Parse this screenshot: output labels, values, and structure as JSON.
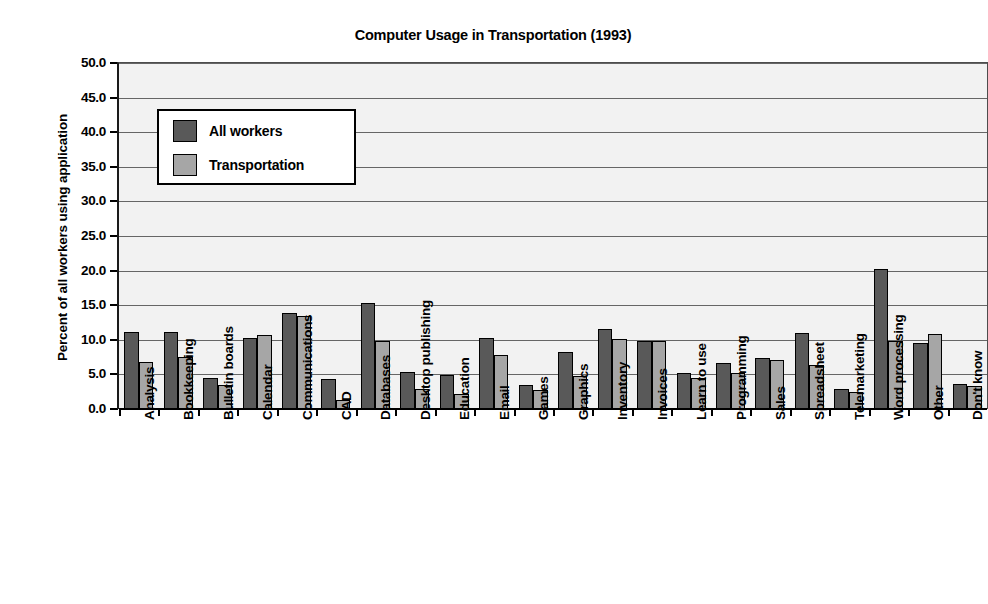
{
  "chart_data": {
    "type": "bar",
    "title": "Computer Usage in Transportation (1993)",
    "xlabel": "",
    "ylabel": "Percent of all workers using application",
    "ylim": [
      0,
      50
    ],
    "ytick_labels": [
      "50.0",
      "45.0",
      "40.0",
      "35.0",
      "30.0",
      "25.0",
      "20.0",
      "15.0",
      "10.0",
      "5.0",
      "0.0"
    ],
    "ytick_values": [
      50,
      45,
      40,
      35,
      30,
      25,
      20,
      15,
      10,
      5,
      0
    ],
    "grid": true,
    "legend_position": "upper-left-inside",
    "categories": [
      "Analysis",
      "Bookkeeping",
      "Bulletin boards",
      "Calendar",
      "Communications",
      "CAD",
      "Databases",
      "Desktop publishing",
      "Education",
      "Email",
      "Games",
      "Graphics",
      "Inventory",
      "Invoices",
      "Learn to use",
      "Programming",
      "Sales",
      "Spreadsheet",
      "Telemarketing",
      "Word processing",
      "Other",
      "Don't know"
    ],
    "series": [
      {
        "name": "All workers",
        "color": "#595959",
        "values": [
          11.1,
          11.1,
          4.5,
          10.3,
          13.9,
          4.4,
          15.3,
          5.3,
          4.9,
          10.2,
          3.5,
          8.3,
          11.6,
          9.8,
          5.2,
          6.6,
          7.4,
          11.0,
          2.9,
          20.3,
          9.6,
          3.6
        ]
      },
      {
        "name": "Transportation",
        "color": "#a6a6a6",
        "values": [
          6.8,
          7.5,
          3.5,
          10.7,
          13.5,
          1.3,
          9.8,
          2.9,
          2.2,
          7.8,
          2.7,
          4.8,
          10.1,
          9.8,
          4.5,
          5.2,
          7.1,
          6.3,
          2.5,
          9.8,
          10.8,
          3.3
        ]
      }
    ],
    "legend": [
      {
        "label": "All workers",
        "color": "#595959"
      },
      {
        "label": "Transportation",
        "color": "#a6a6a6"
      }
    ],
    "plot_background": "#f2f2f2",
    "axis_color": "#000000",
    "gridline_color": "#666666"
  }
}
